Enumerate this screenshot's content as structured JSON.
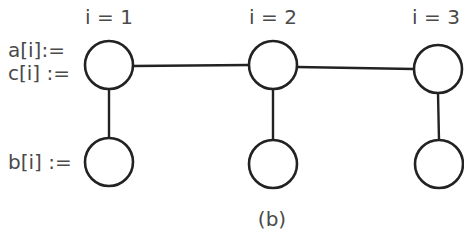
{
  "diagram": {
    "caption": "(b)",
    "row_labels": {
      "top_a": "a[i]:=",
      "top_c": "c[i] :=",
      "bottom_b": "b[i] :="
    },
    "columns": [
      {
        "label": "i = 1",
        "top_node": {
          "cx": 109,
          "cy": 65
        },
        "bottom_node": {
          "cx": 109,
          "cy": 162
        }
      },
      {
        "label": "i = 2",
        "top_node": {
          "cx": 273,
          "cy": 65
        },
        "bottom_node": {
          "cx": 273,
          "cy": 164
        }
      },
      {
        "label": "i = 3",
        "top_node": {
          "cx": 438,
          "cy": 69
        },
        "bottom_node": {
          "cx": 439,
          "cy": 164
        }
      }
    ],
    "node_radius": 24,
    "edges": [
      {
        "from": "top-1",
        "to": "top-2",
        "type": "horizontal"
      },
      {
        "from": "top-2",
        "to": "top-3",
        "type": "horizontal"
      },
      {
        "from": "top-1",
        "to": "bottom-1",
        "type": "vertical"
      },
      {
        "from": "top-2",
        "to": "bottom-2",
        "type": "vertical"
      },
      {
        "from": "top-3",
        "to": "bottom-3",
        "type": "vertical"
      }
    ],
    "colors": {
      "stroke": "#222222",
      "text": "#4a4a4a",
      "background": "#ffffff"
    }
  }
}
